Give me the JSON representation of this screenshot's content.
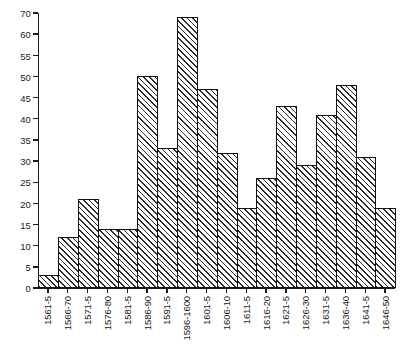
{
  "chart_data": {
    "type": "bar",
    "title": "",
    "xlabel": "",
    "ylabel": "",
    "ylim": [
      0,
      70
    ],
    "grid": false,
    "legend": null,
    "yticks": [
      0,
      5,
      10,
      15,
      20,
      25,
      30,
      35,
      40,
      45,
      50,
      55,
      60,
      70
    ],
    "ytick_labels": [
      "0",
      "5",
      "10",
      "15",
      "20",
      "25",
      "30",
      "35",
      "40",
      "45",
      "50",
      "55",
      "60",
      "70"
    ],
    "categories": [
      "1561-5",
      "1566-70",
      "1571-5",
      "1576-80",
      "1581-5",
      "1586-90",
      "1591-5",
      "1596-1600",
      "1601-5",
      "1606-10",
      "1611-5",
      "1616-20",
      "1621-5",
      "1626-30",
      "1631-5",
      "1636-40",
      "1641-5",
      "1646-50"
    ],
    "values": [
      3,
      12,
      21,
      14,
      14,
      50,
      33,
      68,
      47,
      32,
      19,
      26,
      43,
      29,
      41,
      48,
      31,
      19
    ],
    "bar_style": {
      "fill": "diagonal-hatch",
      "hatch_angle_deg": 45,
      "edge_color": "#111111",
      "face_color": "#ffffff",
      "hatch_color": "#2b2b2b"
    }
  }
}
